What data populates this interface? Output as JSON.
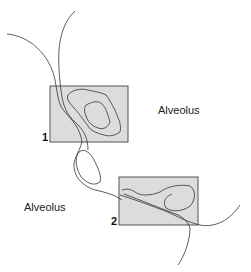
{
  "labels": {
    "alveolus_right": "Alveolus",
    "alveolus_left": "Alveolus",
    "box1_number": "1",
    "box2_number": "2"
  },
  "colors": {
    "box_fill": "#dcdcdc",
    "box_stroke": "#555555",
    "line": "#333333"
  }
}
